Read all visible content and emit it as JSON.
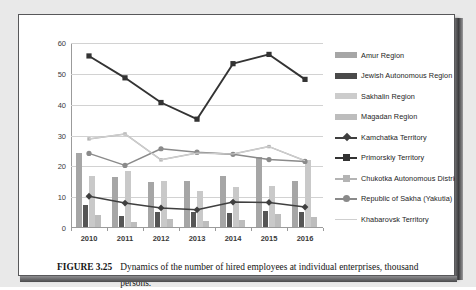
{
  "figure": {
    "label": "FIGURE 3.25",
    "caption": "Dynamics of the number of hired employees at individual enterprises, thousand persons.",
    "footnote_marker": "29"
  },
  "chart_data": {
    "type": "bar",
    "title": "",
    "xlabel": "",
    "ylabel": "",
    "ylim": [
      0,
      60
    ],
    "yticks": [
      0,
      10,
      20,
      30,
      40,
      50,
      60
    ],
    "grid": true,
    "legend_position": "right",
    "categories": [
      "2010",
      "2011",
      "2012",
      "2013",
      "2014",
      "2015",
      "2016"
    ],
    "series": [
      {
        "name": "Amur Region",
        "kind": "bar",
        "color": "#a6a6a6",
        "values": [
          24.1,
          16.3,
          14.5,
          15.0,
          16.4,
          22.6,
          15.0
        ]
      },
      {
        "name": "Jewish Autonomous Region",
        "kind": "bar",
        "color": "#555555",
        "values": [
          7.1,
          3.7,
          5.0,
          5.0,
          4.4,
          5.2,
          4.9
        ]
      },
      {
        "name": "Sakhalin Region",
        "kind": "bar",
        "color": "#c9c9c9",
        "values": [
          16.6,
          18.1,
          14.8,
          11.6,
          13.0,
          13.4,
          21.6
        ]
      },
      {
        "name": "Magadan Region",
        "kind": "bar",
        "color": "#bdbdbd",
        "values": [
          3.9,
          1.7,
          2.7,
          1.9,
          2.4,
          4.2,
          3.3
        ]
      },
      {
        "name": "Kamchatka Territory",
        "kind": "line",
        "color": "#3f3f3f",
        "marker": "diamond",
        "values": [
          10.3,
          8.1,
          6.5,
          5.9,
          8.4,
          8.3,
          6.8
        ]
      },
      {
        "name": "Primorskiy Territory",
        "kind": "line",
        "color": "#333333",
        "marker": "square",
        "values": [
          55.8,
          48.7,
          40.7,
          35.3,
          53.3,
          56.3,
          48.2
        ]
      },
      {
        "name": "Chukotka Autonomous District",
        "kind": "line",
        "color": "#b4b4b4",
        "marker": "square",
        "values": [
          28.9,
          30.5,
          22.1,
          24.3,
          24.0,
          26.4,
          21.8
        ]
      },
      {
        "name": "Republic of Sakha (Yakutia)",
        "kind": "line",
        "color": "#8a8a8a",
        "marker": "circle",
        "values": [
          24.2,
          20.3,
          25.7,
          24.6,
          23.9,
          22.2,
          21.6
        ]
      },
      {
        "name": "Khabarovsk Territory",
        "kind": "line",
        "color": "#cfcfcf",
        "marker": "none",
        "values": [
          28.9,
          30.5,
          22.1,
          24.3,
          24.0,
          26.4,
          21.8
        ]
      }
    ]
  },
  "legend": {
    "items": [
      {
        "label": "Amur Region",
        "key": "swatch",
        "color": "#a6a6a6"
      },
      {
        "label": "Jewish Autonomous Region",
        "key": "swatch",
        "color": "#4a4a4a"
      },
      {
        "label": "Sakhalin Region",
        "key": "swatch",
        "color": "#cccccc"
      },
      {
        "label": "Magadan Region",
        "key": "swatch",
        "color": "#bdbdbd"
      },
      {
        "label": "Kamchatka Territory",
        "key": "line-diamond",
        "color": "#3f3f3f"
      },
      {
        "label": "Primorskiy Territory",
        "key": "line-square",
        "color": "#333333"
      },
      {
        "label": "Chukotka Autonomous District",
        "key": "line-square",
        "color": "#b4b4b4"
      },
      {
        "label": "Republic of Sakha (Yakutia)",
        "key": "line-circle",
        "color": "#8a8a8a"
      },
      {
        "label": "Khabarovsk Territory",
        "key": "line-plain",
        "color": "#cfcfcf"
      }
    ]
  }
}
